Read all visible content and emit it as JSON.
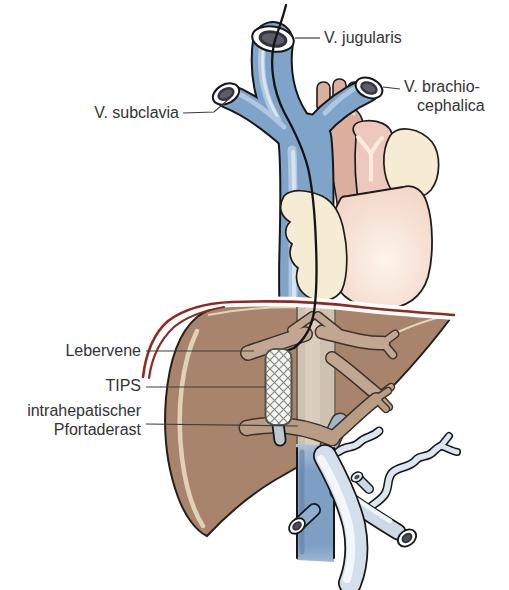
{
  "figure": {
    "labels": {
      "jugularis": "V. jugularis",
      "brachiocephalica_line1": "V. brachio-",
      "brachiocephalica_line2": "cephalica",
      "subclavia": "V. subclavia",
      "lebervene": "Lebervene",
      "tips": "TIPS",
      "pfortaderast_line1": "intrahepatischer",
      "pfortaderast_line2": "Pfortaderast"
    },
    "colors": {
      "vein_blue": "#7fa3c9",
      "vein_highlight": "#aec8e0",
      "vein_bright": "#d9e6f2",
      "ivc_blue": "#7e9fc4",
      "portal_light": "#d4dfec",
      "heart_peach": "#f2d7c9",
      "heart_highlight": "#fbf0e6",
      "aorta_rose": "#dcae9e",
      "pulmonary_pink": "#ecc9bc",
      "auricle_cream": "#f6ecd4",
      "liver_brown": "#a8846c",
      "liver_highlight": "#e6d9c0",
      "vessel_tan": "#c1a791",
      "portal_tan": "#b89d84",
      "retro_cava_tan": "#cfc1b2",
      "diaphragm_red": "#8e2a22",
      "stent_white": "#f7f6f2",
      "stent_mesh": "#7f8a81",
      "catheter_black": "#141414",
      "outline_black": "#1f1c1a",
      "text": "#333333",
      "leader_line": "#3d3d3d"
    }
  }
}
